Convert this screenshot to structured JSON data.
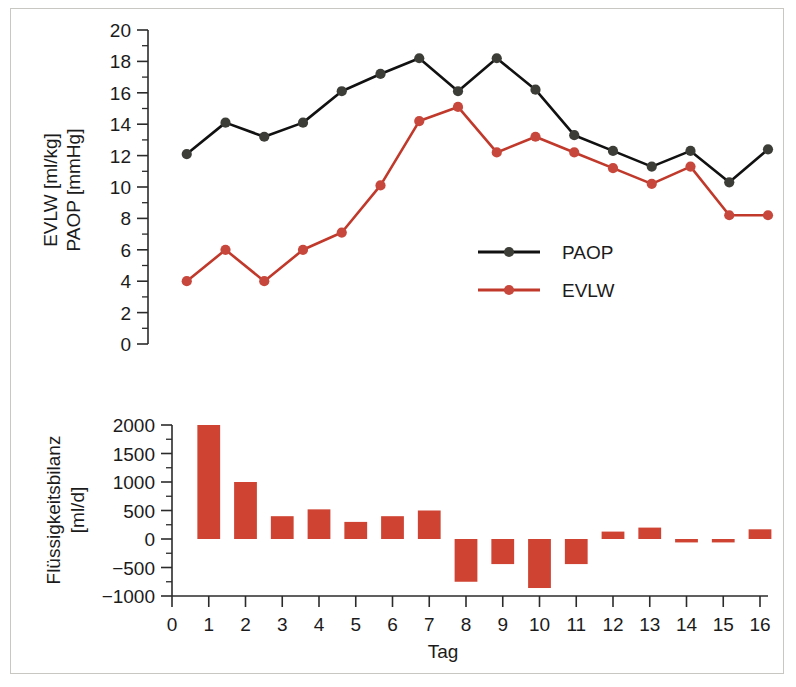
{
  "figure": {
    "background": "#ffffff",
    "border_color": "#c9c7c2"
  },
  "chart_data": [
    {
      "type": "line",
      "id": "top-panel",
      "title": "",
      "xlabel": "",
      "ylabel": "EVLW [ml/kg]\nPAOP [mmHg]",
      "ylabel_line1": "EVLW [ml/kg]",
      "ylabel_line2": "PAOP [mmHg]",
      "x": [
        1,
        2,
        3,
        4,
        5,
        6,
        7,
        8,
        9,
        10,
        11,
        12,
        13,
        14,
        15,
        16
      ],
      "xlim": [
        0,
        16
      ],
      "ylim": [
        0,
        20
      ],
      "yticks": [
        0,
        2,
        4,
        6,
        8,
        10,
        12,
        14,
        16,
        18,
        20
      ],
      "ytick_labels": [
        "0",
        "2",
        "4",
        "6",
        "8",
        "10",
        "12",
        "14",
        "16",
        "18",
        "20"
      ],
      "minor_ticks": true,
      "grid": false,
      "legend_position": "center-right",
      "series": [
        {
          "name": "PAOP",
          "color": "#3d3d38",
          "line_color": "#111111",
          "values": [
            12.1,
            14.1,
            13.2,
            14.1,
            16.1,
            17.2,
            18.2,
            16.1,
            18.2,
            16.2,
            13.3,
            12.3,
            11.3,
            12.3,
            10.3,
            12.4
          ]
        },
        {
          "name": "EVLW",
          "color": "#c8473c",
          "line_color": "#c0392b",
          "values": [
            4.0,
            6.0,
            4.0,
            6.0,
            7.1,
            10.1,
            14.2,
            15.1,
            12.2,
            13.2,
            12.2,
            11.2,
            10.2,
            11.3,
            8.2,
            8.2
          ]
        }
      ]
    },
    {
      "type": "bar",
      "id": "bottom-panel",
      "title": "",
      "xlabel": "Tag",
      "ylabel": "Flüssigkeitsbilanz\n[ml/d]",
      "ylabel_line1": "Flüssigkeitsbilanz",
      "ylabel_line2": "[ml/d]",
      "categories": [
        1,
        2,
        3,
        4,
        5,
        6,
        7,
        8,
        9,
        10,
        11,
        12,
        13,
        14,
        15,
        16
      ],
      "values": [
        2000,
        1000,
        400,
        520,
        300,
        400,
        500,
        -750,
        -440,
        -860,
        -440,
        130,
        200,
        -60,
        -60,
        170
      ],
      "bar_color": "#cf4332",
      "xlim": [
        0,
        16
      ],
      "ylim": [
        -1000,
        2000
      ],
      "yticks": [
        -1000,
        -500,
        0,
        500,
        1000,
        1500,
        2000
      ],
      "ytick_labels": [
        "-1000",
        "-500",
        "0",
        "500",
        "1000",
        "1500",
        "2000"
      ],
      "xticks": [
        0,
        1,
        2,
        3,
        4,
        5,
        6,
        7,
        8,
        9,
        10,
        11,
        12,
        13,
        14,
        15,
        16
      ],
      "xtick_labels": [
        "0",
        "1",
        "2",
        "3",
        "4",
        "5",
        "6",
        "7",
        "8",
        "9",
        "10",
        "11",
        "12",
        "13",
        "14",
        "15",
        "16"
      ],
      "minor_ticks": true,
      "grid": false
    }
  ],
  "legend": {
    "items": [
      {
        "label": "PAOP",
        "color": "#3d3d38",
        "line_color": "#111111"
      },
      {
        "label": "EVLW",
        "color": "#c8473c",
        "line_color": "#c0392b"
      }
    ]
  }
}
